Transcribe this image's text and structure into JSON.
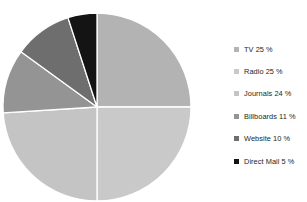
{
  "chart_data": {
    "type": "pie",
    "title": "",
    "subtitle": "",
    "xlabel": "",
    "ylabel": "",
    "legend_position": "right",
    "grid": false,
    "start_angle_deg": 0,
    "direction": "clockwise",
    "categories": [
      "TV",
      "Radio",
      "Journals",
      "Billboards",
      "Website",
      "Direct Mail"
    ],
    "values": [
      25,
      25,
      24,
      11,
      10,
      5
    ],
    "value_unit": "%",
    "slices": [
      {
        "label": "TV",
        "value": 25,
        "unit": "%",
        "color": "#b3b3b3",
        "legend_text": "TV 25 %"
      },
      {
        "label": "Radio",
        "value": 25,
        "unit": "%",
        "color": "#c9c9c9",
        "legend_text": "Radio 25 %"
      },
      {
        "label": "Journals",
        "value": 24,
        "unit": "%",
        "color": "#c4c4c4",
        "legend_text": "Journals 24 %"
      },
      {
        "label": "Billboards",
        "value": 11,
        "unit": "%",
        "color": "#949494",
        "legend_text": "Billboards 11 %"
      },
      {
        "label": "Website",
        "value": 10,
        "unit": "%",
        "color": "#6e6e6e",
        "legend_text": "Website 10 %"
      },
      {
        "label": "Direct Mail",
        "value": 5,
        "unit": "%",
        "color": "#141414",
        "legend_text": "Direct Mail 5 %"
      }
    ]
  },
  "legend": {
    "items": [
      {
        "text": "TV 25 %",
        "color": "#b3b3b3"
      },
      {
        "text": "Radio 25 %",
        "color": "#c9c9c9"
      },
      {
        "text": "Journals 24 %",
        "color": "#c4c4c4"
      },
      {
        "text": "Billboards 11 %",
        "color": "#949494"
      },
      {
        "text": "Website 10 %",
        "color": "#6e6e6e"
      },
      {
        "text": "Direct Mail 5 %",
        "color": "#141414"
      }
    ]
  },
  "style": {
    "background": "#ffffff",
    "separator_color": "#ffffff",
    "text_color": "#231f20"
  },
  "geometry": {
    "center_x": 97,
    "center_y": 107,
    "radius": 94
  }
}
